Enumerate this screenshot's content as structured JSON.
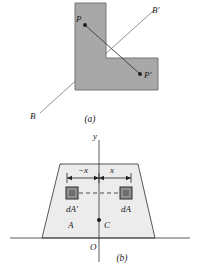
{
  "figure": {
    "panels": [
      {
        "id": "a",
        "caption": "(a)",
        "description": "L-shaped plane region with point P and its mirror image P' reflected across axis B-B'",
        "shape_name": "l-shaped-region",
        "fill_color": "#a8a8a8",
        "stroke_color": "#555555",
        "labels": {
          "point_p": "P",
          "point_p_prime": "P'",
          "axis_start": "B",
          "axis_end": "B'"
        }
      },
      {
        "id": "b",
        "caption": "(b)",
        "description": "Trapezoidal area A symmetric about the y axis, showing element dA at x and its counterpart dA' at -x, with centroid C on the axis",
        "shape_name": "trapezoid-region",
        "fill_color": "#ececec",
        "stroke_color": "#444444",
        "labels": {
          "y_axis": "y",
          "origin": "O",
          "area": "A",
          "centroid": "C",
          "element_right": "dA",
          "element_left": "dA'",
          "dim_right": "x",
          "dim_left": "−x"
        }
      }
    ]
  }
}
